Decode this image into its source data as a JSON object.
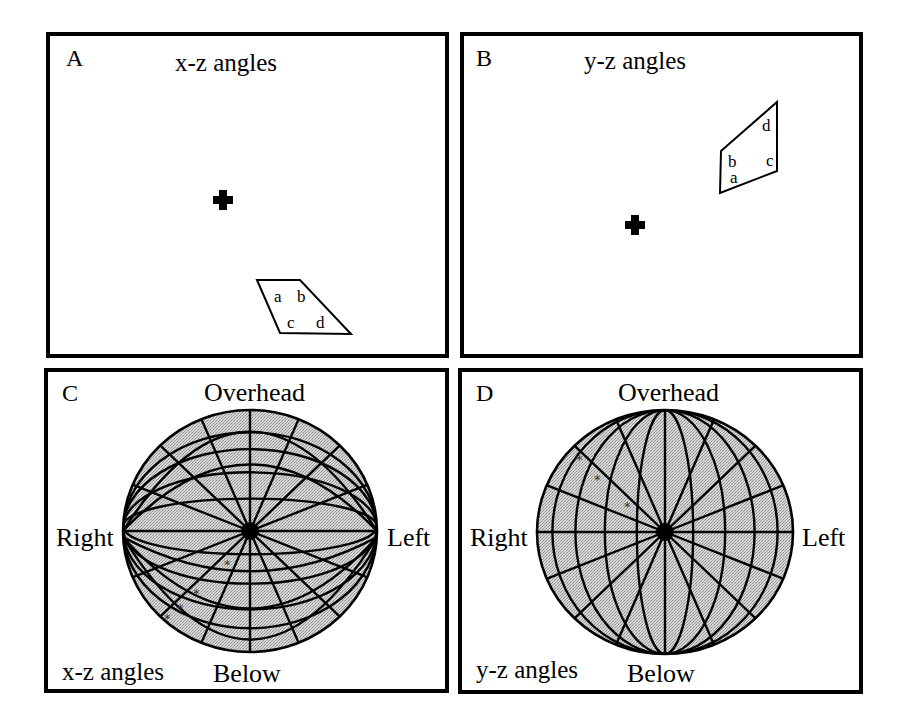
{
  "figure": {
    "panels": [
      {
        "id": "A",
        "letter": "A",
        "title": "x-z angles",
        "fixation_cross": {
          "cx": 223,
          "cy": 200
        },
        "quadrilateral": {
          "points": [
            [
              257,
              280
            ],
            [
              300,
              280
            ],
            [
              351,
              334
            ],
            [
              280,
              333
            ]
          ],
          "vertex_labels": [
            {
              "text": "a",
              "x": 274,
              "y": 289
            },
            {
              "text": "b",
              "x": 297,
              "y": 289
            },
            {
              "text": "c",
              "x": 287,
              "y": 315
            },
            {
              "text": "d",
              "x": 316,
              "y": 315
            }
          ]
        }
      },
      {
        "id": "B",
        "letter": "B",
        "title": "y-z angles",
        "fixation_cross": {
          "cx": 635,
          "cy": 225
        },
        "quadrilateral": {
          "points": [
            [
              721,
              151
            ],
            [
              777,
              102
            ],
            [
              777,
              171
            ],
            [
              720,
              193
            ]
          ],
          "vertex_labels": [
            {
              "text": "d",
              "x": 762,
              "y": 118
            },
            {
              "text": "b",
              "x": 728,
              "y": 154
            },
            {
              "text": "c",
              "x": 766,
              "y": 153
            },
            {
              "text": "a",
              "x": 730,
              "y": 170
            }
          ]
        }
      },
      {
        "id": "C",
        "letter": "C",
        "globe_type": "x-z",
        "labels": {
          "top": "Overhead",
          "bottom": "Below",
          "left": "Right",
          "right": "Left",
          "corner": "x-z angles"
        },
        "globe": {
          "cx": 250,
          "cy": 531,
          "rx": 127,
          "ry": 121
        },
        "markers": [
          [
            197,
            592
          ],
          [
            181,
            607
          ],
          [
            168,
            617
          ],
          [
            228,
            563
          ]
        ]
      },
      {
        "id": "D",
        "letter": "D",
        "globe_type": "y-z",
        "labels": {
          "top": "Overhead",
          "bottom": "Below",
          "left": "Right",
          "right": "Left",
          "corner": "y-z angles"
        },
        "globe": {
          "cx": 665,
          "cy": 532,
          "rx": 128,
          "ry": 122
        },
        "markers": [
          [
            580,
            458
          ],
          [
            598,
            478
          ],
          [
            628,
            505
          ]
        ]
      }
    ],
    "colors": {
      "ink": "#000000",
      "globe_fill": "#c9c9c9",
      "background": "#ffffff"
    }
  }
}
